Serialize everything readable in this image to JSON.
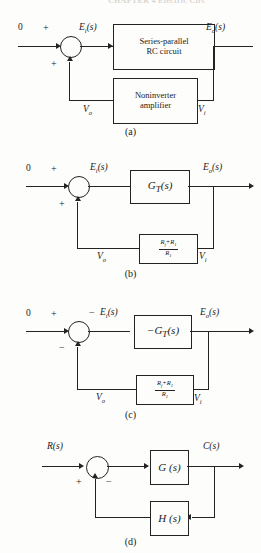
{
  "running_head": "CHAPTER 4  Electric Circ",
  "figures": [
    {
      "id": "a",
      "caption": "(a)",
      "input_label": "0",
      "signs": {
        "left": "+",
        "bottom": "+"
      },
      "node_labels": {
        "after_sum": "E",
        "after_sum_sub": "i",
        "after_sum_tail": "(s)",
        "output": "E",
        "output_sub": "o",
        "output_tail": "(s)",
        "feedback_left": "V",
        "feedback_left_sub": "o",
        "feedback_right": "V",
        "feedback_right_sub": "i"
      },
      "forward_block": {
        "line1": "Series-parallel",
        "line2": "RC circuit"
      },
      "feedback_block": {
        "line1": "Noninverter",
        "line2": "amplifier"
      }
    },
    {
      "id": "b",
      "caption": "(b)",
      "input_label": "0",
      "signs": {
        "left": "+",
        "bottom": "+"
      },
      "forward_block_math": "G",
      "forward_block_sub": "T",
      "forward_block_tail": "(s)",
      "feedback_fraction": {
        "numerator_a": "R",
        "numerator_a_sub": "f",
        "numerator_op": "+",
        "numerator_b": "R",
        "numerator_b_sub": "1",
        "denominator": "R",
        "denominator_sub": "1"
      }
    },
    {
      "id": "c",
      "caption": "(c)",
      "input_label": "0",
      "signs": {
        "left": "+",
        "top_right": "−",
        "bottom": "−"
      },
      "forward_block_prefix": "−",
      "forward_block_math": "G",
      "forward_block_sub": "T",
      "forward_block_tail": "(s)",
      "feedback_fraction": {
        "numerator_a": "R",
        "numerator_a_sub": "f",
        "numerator_op": "+",
        "numerator_b": "R",
        "numerator_b_sub": "1",
        "denominator": "R",
        "denominator_sub": "1"
      }
    },
    {
      "id": "d",
      "caption": "(d)",
      "input_label": "R",
      "input_label_sub": "",
      "input_label_tail": "(s)",
      "signs": {
        "bottom_left": "+",
        "bottom_right": "−"
      },
      "forward_block": "G (s)",
      "feedback_block": "H (s)",
      "output_label": "C(s)"
    }
  ],
  "colors": {
    "ink": "#232323",
    "paper": "#fdfdfb"
  }
}
